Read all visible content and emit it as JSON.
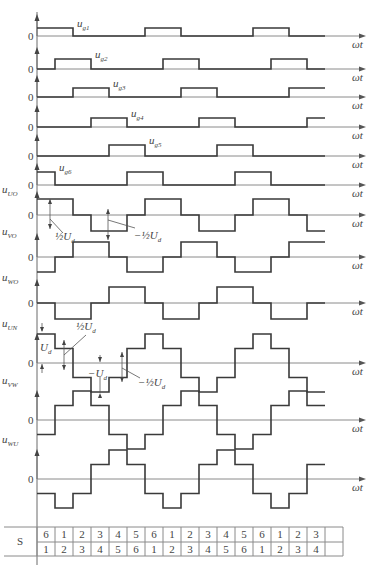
{
  "figure": {
    "x_axis_label": "ωt",
    "zero_label": "0",
    "step_count": 17,
    "x0": 37,
    "step_width": 18,
    "axis_end": 366
  },
  "gate_signals": [
    {
      "label": "u",
      "sub": "g1",
      "baseline": 36,
      "height": 8,
      "on_phase": [
        0,
        1
      ]
    },
    {
      "label": "u",
      "sub": "g2",
      "baseline": 69,
      "height": 10,
      "on_phase": [
        1,
        2
      ]
    },
    {
      "label": "u",
      "sub": "g3",
      "baseline": 97,
      "height": 9,
      "on_phase": [
        2,
        3
      ]
    },
    {
      "label": "u",
      "sub": "g4",
      "baseline": 127,
      "height": 9,
      "on_phase": [
        3,
        4
      ]
    },
    {
      "label": "u",
      "sub": "g5",
      "baseline": 156,
      "height": 11,
      "on_phase": [
        4,
        5
      ]
    },
    {
      "label": "u",
      "sub": "g6",
      "baseline": 185,
      "height": 13,
      "on_phase": [
        5,
        0
      ]
    }
  ],
  "phase_voltages": [
    {
      "label": "u",
      "sub": "UO",
      "baseline": 215,
      "amp": 16,
      "pos_phase": [
        0,
        1
      ],
      "neg_phase": [
        3,
        4
      ]
    },
    {
      "label": "u",
      "sub": "VO",
      "baseline": 257,
      "amp": 15,
      "pos_phase": [
        2,
        3
      ],
      "neg_phase": [
        5,
        0
      ]
    },
    {
      "label": "u",
      "sub": "WO",
      "baseline": 303,
      "amp": 16,
      "pos_phase": [
        4,
        5
      ],
      "neg_phase": [
        1,
        2
      ]
    }
  ],
  "line_voltages": {
    "unit_px": 14.5,
    "pattern": [
      2,
      1,
      -1,
      -2,
      -1,
      1
    ],
    "series": [
      {
        "label": "u",
        "sub": "UN",
        "baseline": 363,
        "shift": 0
      },
      {
        "label": "u",
        "sub": "VW",
        "baseline": 420,
        "shift": 2
      },
      {
        "label": "u",
        "sub": "WU",
        "baseline": 479,
        "shift": 4
      }
    ]
  },
  "annotations": {
    "half_ud": "½U",
    "half_ud_sub": "d",
    "neg_half_ud": "−½U",
    "ud": "U",
    "neg_ud": "−U",
    "ud_sub": "d"
  },
  "switch_table": {
    "row_label": "S",
    "upper": [
      "6",
      "1",
      "2",
      "3",
      "4",
      "5",
      "6",
      "1",
      "2",
      "3",
      "4",
      "5",
      "6",
      "1",
      "2",
      "3",
      ""
    ],
    "lower": [
      "1",
      "2",
      "3",
      "4",
      "5",
      "6",
      "1",
      "2",
      "3",
      "4",
      "5",
      "6",
      "1",
      "2",
      "3",
      "4",
      ""
    ]
  }
}
